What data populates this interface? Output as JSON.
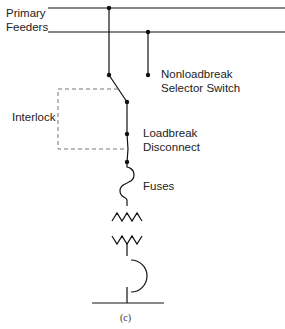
{
  "diagram": {
    "labels": {
      "primary_feeders_line1": "Primary",
      "primary_feeders_line2": "Feeders",
      "selector_line1": "Nonloadbreak",
      "selector_line2": "Selector Switch",
      "interlock": "Interlock",
      "loadbreak_line1": "Loadbreak",
      "loadbreak_line2": "Disconnect",
      "fuses": "Fuses",
      "caption": "(c)"
    },
    "colors": {
      "line": "#111111",
      "dashed": "#777777",
      "text": "#222222"
    }
  }
}
